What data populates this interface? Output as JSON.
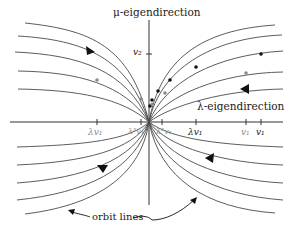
{
  "diagram": {
    "type": "phase-portrait",
    "vertical_axis_label": "μ-eigendirection",
    "horizontal_axis_label": "λ-eigendirection",
    "vertical_ticks": [
      {
        "label": "v₂",
        "y": 54,
        "tone": "dark"
      }
    ],
    "horizontal_ticks": [
      {
        "label": "λv₁",
        "x": 97,
        "tone": "gray"
      },
      {
        "label": "λ³v₁",
        "x": 141,
        "tone": "gray"
      },
      {
        "label": "λ²v₁",
        "x": 162,
        "tone": "gray"
      },
      {
        "label": "λv₁",
        "x": 196,
        "tone": "dark"
      },
      {
        "label": "v₁",
        "x": 246,
        "tone": "gray"
      },
      {
        "label": "v₁",
        "x": 261,
        "tone": "dark"
      }
    ],
    "annotation": "orbit lines",
    "colors": {
      "curve": "#4a4a4a",
      "axis": "#333333",
      "gray_point": "#8a8a8a",
      "dark_point": "#111111"
    }
  }
}
